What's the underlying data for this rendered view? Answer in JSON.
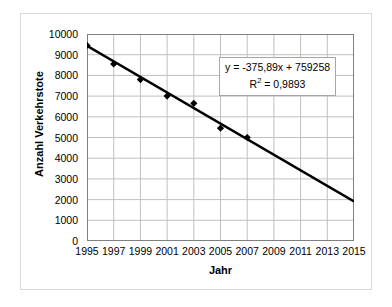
{
  "chart_data": {
    "type": "scatter",
    "title": "",
    "xlabel": "Jahr",
    "ylabel": "Anzahl Verkehrstote",
    "xlim": [
      1995,
      2015
    ],
    "ylim": [
      0,
      10000
    ],
    "xticks": [
      1995,
      1997,
      1999,
      2001,
      2003,
      2005,
      2007,
      2009,
      2011,
      2013,
      2015
    ],
    "yticks": [
      0,
      1000,
      2000,
      3000,
      4000,
      5000,
      6000,
      7000,
      8000,
      9000,
      10000
    ],
    "xtick_labels": [
      "1995",
      "1997",
      "1999",
      "2001",
      "2003",
      "2005",
      "2007",
      "2009",
      "2011",
      "2013",
      "2015"
    ],
    "ytick_labels": [
      "0",
      "1000",
      "2000",
      "3000",
      "4000",
      "5000",
      "6000",
      "7000",
      "8000",
      "9000",
      "10000"
    ],
    "grid": true,
    "legend": "none",
    "x": [
      1995,
      1997,
      1999,
      2001,
      2003,
      2005,
      2007
    ],
    "values": [
      9450,
      8550,
      7800,
      7000,
      6650,
      5450,
      5000
    ],
    "series": [
      {
        "name": "Anzahl Verkehrstote",
        "marker": "diamond",
        "color": "#000000",
        "x": [
          1995,
          1997,
          1999,
          2001,
          2003,
          2005,
          2007
        ],
        "values": [
          9450,
          8550,
          7800,
          7000,
          6650,
          5450,
          5000
        ]
      }
    ],
    "trendline": {
      "type": "linear",
      "slope": -375.89,
      "intercept": 759258,
      "r_squared": 0.9893,
      "equation_text": "y = -375,89x + 759258",
      "r2_text": "R",
      "r2_exponent": "2",
      "r2_value_text": " = 0,9893",
      "x_start": 1995,
      "x_end": 2015,
      "y_start": 9427,
      "y_end": 1909,
      "color": "#000000"
    },
    "annotations": [
      {
        "name": "trendline-equation-box",
        "line1": "y = -375,89x + 759258",
        "line2_base": "R",
        "line2_sup": "2",
        "line2_rest": " = 0,9893"
      }
    ]
  },
  "axes": {
    "y_title": "Anzahl Verkehrstote",
    "x_title": "Jahr"
  },
  "colors": {
    "plot_border": "#808080",
    "gridline": "#c0c0c0",
    "series": "#000000",
    "trendline": "#000000",
    "figure_border": "#d9d9d9",
    "annotation_border": "#a6a6a6",
    "background": "#ffffff"
  }
}
